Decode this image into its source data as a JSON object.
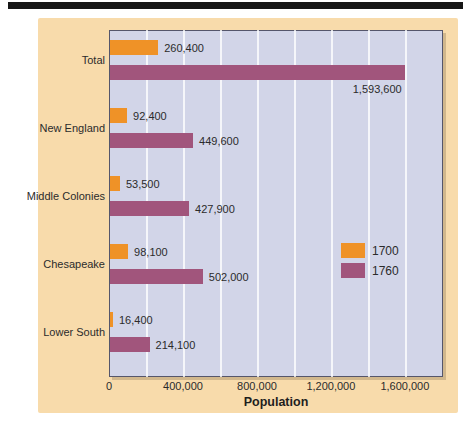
{
  "colors": {
    "series_1700": "#ef9227",
    "series_1760": "#a1557c",
    "plot_background": "#d2d5e8",
    "card_background": "#f8dbab",
    "plot_border": "#55566b",
    "gridline": "#ffffff",
    "text": "#2b2b2b",
    "page_edge_bar": "#161616"
  },
  "chart_data": {
    "type": "bar",
    "orientation": "horizontal",
    "title": "",
    "xlabel": "Population",
    "ylabel": "",
    "categories": [
      "Total",
      "New England",
      "Middle Colonies",
      "Chesapeake",
      "Lower South"
    ],
    "series": [
      {
        "name": "1700",
        "color": "#ef9227",
        "values": [
          260400,
          92400,
          53500,
          98100,
          16400
        ],
        "labels": [
          "260,400",
          "92,400",
          "53,500",
          "98,100",
          "16,400"
        ]
      },
      {
        "name": "1760",
        "color": "#a1557c",
        "values": [
          1593600,
          449600,
          427900,
          502000,
          214100
        ],
        "labels": [
          "1,593,600",
          "449,600",
          "427,900",
          "502,000",
          "214,100"
        ]
      }
    ],
    "xlim": [
      0,
      1806000
    ],
    "x_ticks": [
      {
        "value": 0,
        "label": "0"
      },
      {
        "value": 400000,
        "label": "400,000"
      },
      {
        "value": 800000,
        "label": "800,000"
      },
      {
        "value": 1200000,
        "label": "1,200,000"
      },
      {
        "value": 1600000,
        "label": "1,600,000"
      }
    ],
    "gridline_interval": 200000,
    "grid": "on",
    "legend": {
      "position": "middle-right",
      "entries": [
        {
          "label": "1700",
          "color": "#ef9227"
        },
        {
          "label": "1760",
          "color": "#a1557c"
        }
      ]
    }
  }
}
